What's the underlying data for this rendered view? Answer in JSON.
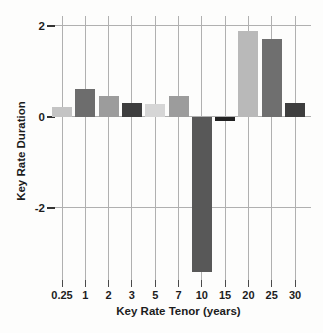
{
  "figure": {
    "background": "#fdfdfc"
  },
  "chart_data": {
    "type": "bar",
    "title": "",
    "xlabel": "Key Rate Tenor (years)",
    "ylabel": "Key Rate Duration",
    "categories": [
      "0.25",
      "1",
      "2",
      "3",
      "5",
      "7",
      "10",
      "15",
      "20",
      "25",
      "30"
    ],
    "values": [
      0.22,
      0.6,
      0.46,
      0.3,
      0.27,
      0.46,
      -3.43,
      -0.1,
      1.89,
      1.72,
      0.31
    ],
    "bar_colors": [
      "#c4c4c4",
      "#6d6d6d",
      "#9c9c9c",
      "#3e3e3e",
      "#d6d6d6",
      "#9c9c9c",
      "#585858",
      "#222222",
      "#b9b9b9",
      "#6f6f6f",
      "#3e3e3e"
    ],
    "y_ticks": [
      2,
      0,
      -2
    ],
    "y_tick_labels": [
      "2",
      "0",
      "-2"
    ],
    "ylim": [
      -3.72,
      2.22
    ],
    "grid": true,
    "legend": false,
    "gridline_color": "#b0b0b0",
    "tick_color": "#4a4a4a",
    "text_color": "#1c1c1c"
  }
}
